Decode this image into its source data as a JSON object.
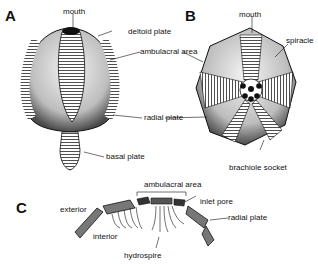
{
  "figure": {
    "panels": [
      {
        "id": "A",
        "label": "A",
        "view": "lateral view of blastoid theca"
      },
      {
        "id": "B",
        "label": "B",
        "view": "oral view of blastoid theca"
      },
      {
        "id": "C",
        "label": "C",
        "view": "cross-section through ambulacrum"
      }
    ],
    "labels": {
      "a_mouth": "mouth",
      "a_deltoid": "deltoid plate",
      "a_ambulacral": "ambulacral area",
      "a_radial": "radial plate",
      "a_basal": "basal plate",
      "b_mouth": "mouth",
      "b_spiracle": "spiracle",
      "b_brachiole": "brachiole socket",
      "c_ambulacral": "ambulacral area",
      "c_inlet": "inlet pore",
      "c_radial": "radial plate",
      "c_exterior": "exterior",
      "c_interior": "interior",
      "c_hydrospire": "hydrospire"
    },
    "colors": {
      "ink": "#111111",
      "shade": "#8a8a8a",
      "paper": "#ffffff"
    }
  }
}
